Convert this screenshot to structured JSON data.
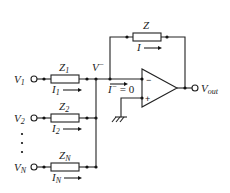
{
  "diagram": {
    "feedback": {
      "impedance": "Z",
      "current": "I"
    },
    "inverting_node": {
      "voltage_label": "V",
      "voltage_sup": "−",
      "current_label": "I",
      "current_sup": "−",
      "current_value": " = 0"
    },
    "opamp": {
      "minus_sign": "−",
      "plus_sign": "+"
    },
    "output": {
      "label": "V",
      "sub": "out"
    },
    "inputs": [
      {
        "voltage": "V",
        "v_sub": "1",
        "impedance": "Z",
        "z_sub": "1",
        "current": "I",
        "i_sub": "1"
      },
      {
        "voltage": "V",
        "v_sub": "2",
        "impedance": "Z",
        "z_sub": "2",
        "current": "I",
        "i_sub": "2"
      },
      {
        "voltage": "V",
        "v_sub": "N",
        "impedance": "Z",
        "z_sub": "N",
        "current": "I",
        "i_sub": "N"
      }
    ],
    "ellipsis": "⋮",
    "ground": "ground-symbol"
  }
}
